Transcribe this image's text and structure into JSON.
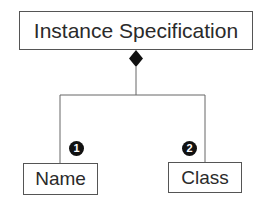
{
  "diagram": {
    "parent": {
      "label": "Instance Specification"
    },
    "children": [
      {
        "label": "Name",
        "badge": "1"
      },
      {
        "label": "Class",
        "badge": "2"
      }
    ],
    "relationship": "composition",
    "colors": {
      "line": "#666666",
      "diamond": "#111111",
      "badge_bg": "#111111",
      "badge_text": "#ffffff"
    }
  }
}
